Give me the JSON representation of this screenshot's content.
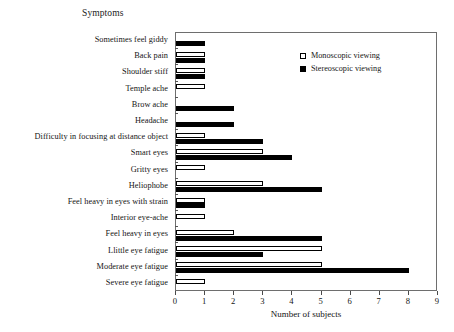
{
  "chart_data": {
    "type": "bar",
    "orientation": "horizontal",
    "title": "Symptoms",
    "xlabel": "Number of subjects",
    "ylabel": "",
    "xlim": [
      0,
      9
    ],
    "xticks": [
      0,
      1,
      2,
      3,
      4,
      5,
      6,
      7,
      8,
      9
    ],
    "grid": false,
    "legend_position": "top-right",
    "categories": [
      "Sometimes feel giddy",
      "Back pain",
      "Shoulder stiff",
      "Temple ache",
      "Brow ache",
      "Headache",
      "Difficulty in focusing at distance object",
      "Smart eyes",
      "Gritty eyes",
      "Heliophobe",
      "Feel heavy in eyes with strain",
      "Interior eye-ache",
      "Feel heavy in eyes",
      "Llittle eye fatigue",
      "Moderate eye fatigue",
      "Severe eye fatigue"
    ],
    "series": [
      {
        "name": "Monoscopic viewing",
        "color": "#ffffff",
        "edge_color": "#000000",
        "values": [
          0,
          1,
          1,
          1,
          0,
          0,
          1,
          3,
          1,
          3,
          1,
          1,
          2,
          5,
          5,
          1
        ]
      },
      {
        "name": "Stereoscopic viewing",
        "color": "#000000",
        "edge_color": "#000000",
        "values": [
          1,
          1,
          1,
          0,
          2,
          2,
          3,
          4,
          0,
          5,
          1,
          0,
          5,
          3,
          8,
          0
        ]
      }
    ]
  },
  "legend": {
    "items": [
      {
        "label": "Monoscopic viewing",
        "style": "mono"
      },
      {
        "label": "Stereoscopic viewing",
        "style": "stereo"
      }
    ]
  },
  "caption": {
    "fragment": ""
  }
}
